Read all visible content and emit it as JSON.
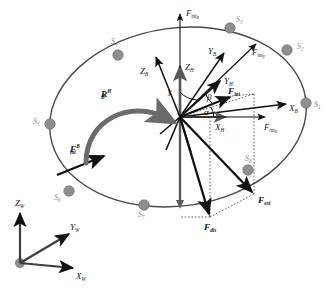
{
  "figure": {
    "type": "force-vector-diagram",
    "colors": {
      "vector_dark": "#111111",
      "axis_gray": "#5a5a5a",
      "node_gray": "#8e8e8e",
      "ring_gray": "#4a4a4a",
      "rotation_arrow": "#6b6b6b",
      "label_dark": "#1a1a1a",
      "label_node": "#8e8e8e",
      "background": "#ffffff"
    }
  },
  "ring": {
    "name": "platform-ellipse",
    "nodes": [
      {
        "id": "S1",
        "label": "S",
        "subscript": "1",
        "x": 306,
        "y": 103,
        "label_x": 314,
        "label_y": 107
      },
      {
        "id": "S2",
        "label": "S",
        "subscript": "2",
        "x": 287,
        "y": 50,
        "label_x": 297,
        "label_y": 49
      },
      {
        "id": "S3",
        "label": "S",
        "subscript": "3",
        "x": 230,
        "y": 28,
        "label_x": 236,
        "label_y": 22
      },
      {
        "id": "S4",
        "label": "S",
        "subscript": "4",
        "x": 118,
        "y": 55,
        "label_x": 113,
        "label_y": 44
      },
      {
        "id": "S5",
        "label": "S",
        "subscript": "5",
        "x": 50,
        "y": 124,
        "label_x": 35,
        "label_y": 124
      },
      {
        "id": "S6",
        "label": "S",
        "subscript": "6",
        "x": 69,
        "y": 191,
        "label_x": 56,
        "label_y": 199
      },
      {
        "id": "S7",
        "label": "S",
        "subscript": "7",
        "x": 144,
        "y": 205,
        "label_x": 140,
        "label_y": 216
      },
      {
        "id": "S8",
        "label": "S",
        "subscript": "8",
        "x": 248,
        "y": 170,
        "label_x": 247,
        "label_y": 161
      }
    ]
  },
  "frames": {
    "world": {
      "name": "world-frame",
      "origin": {
        "x": 20,
        "y": 263
      },
      "axes": [
        {
          "id": "Zw",
          "label": "Z",
          "subscript": "W",
          "tip_x": 20,
          "tip_y": 211,
          "label_x": 18,
          "label_y": 204
        },
        {
          "id": "Yw",
          "label": "Y",
          "subscript": "W",
          "tip_x": 71,
          "tip_y": 233,
          "label_x": 72,
          "label_y": 228
        },
        {
          "id": "Xw",
          "label": "X",
          "subscript": "W",
          "tip_x": 75,
          "tip_y": 268,
          "label_x": 77,
          "label_y": 277
        }
      ]
    },
    "hub": {
      "name": "hub-frame",
      "origin": {
        "x": 180,
        "y": 117
      },
      "axes": [
        {
          "id": "ZH",
          "label": "Z",
          "subscript": "H",
          "tip_x": 180,
          "tip_y": 62,
          "label_x": 185,
          "label_y": 68
        },
        {
          "id": "YH",
          "label": "Y",
          "subscript": "H",
          "tip_x": 222,
          "tip_y": 80,
          "label_x": 224,
          "label_y": 82
        },
        {
          "id": "XH",
          "label": "X",
          "subscript": "H",
          "tip_x": 228,
          "tip_y": 117,
          "label_x": 219,
          "label_y": 128
        }
      ]
    },
    "body": {
      "name": "body-frame",
      "origin": {
        "x": 180,
        "y": 117
      },
      "axes": [
        {
          "id": "ZB",
          "label": "Z",
          "subscript": "B",
          "tip_x": 155,
          "tip_y": 55,
          "label_x": 143,
          "label_y": 72
        },
        {
          "id": "YB",
          "label": "Y",
          "subscript": "B",
          "tip_x": 225,
          "tip_y": 52,
          "label_x": 212,
          "label_y": 53
        },
        {
          "id": "XB",
          "label": "X",
          "subscript": "B",
          "tip_x": 288,
          "tip_y": 104,
          "label_x": 290,
          "label_y": 110
        }
      ]
    }
  },
  "angles": [
    {
      "id": "gamma",
      "glyph": "γ",
      "x": 170,
      "y": 93,
      "between": "Z_H and Y_H"
    },
    {
      "id": "beta",
      "glyph": "β",
      "x": 209,
      "y": 98,
      "between": "Y_H and F_int"
    },
    {
      "id": "alpha",
      "glyph": "α",
      "x": 206,
      "y": 113,
      "between": "X_H and F_int"
    }
  ],
  "vectors": [
    {
      "id": "Fintz",
      "label": "F",
      "subscript": "int",
      "subsub": "z",
      "tip_x": 180,
      "tip_y": 14,
      "label_x": 186,
      "label_y": 14,
      "kind": "component",
      "name": "f-int-z-vector"
    },
    {
      "id": "Finty",
      "label": "F",
      "subscript": "int",
      "subsub": "y",
      "tip_x": 258,
      "tip_y": 42,
      "label_x": 256,
      "label_y": 53,
      "kind": "component",
      "name": "f-int-y-vector"
    },
    {
      "id": "Fintx",
      "label": "F",
      "subscript": "int",
      "subsub": "x",
      "tip_x": 267,
      "tip_y": 117,
      "label_x": 267,
      "label_y": 128,
      "kind": "component",
      "name": "f-int-x-vector"
    },
    {
      "id": "Fint",
      "label": "F",
      "subscript": "int",
      "subsub": "",
      "tip_x": 232,
      "tip_y": 96,
      "label_x": 230,
      "label_y": 95,
      "kind": "resultant",
      "name": "f-int-vector"
    },
    {
      "id": "FintB",
      "label": "F",
      "subscript": "int",
      "superscript": "B",
      "tip_x": 102,
      "tip_y": 155,
      "label_x": 71,
      "label_y": 150,
      "kind": "body-force",
      "name": "f-int-body-vector"
    },
    {
      "id": "Fext",
      "label": "F",
      "subscript": "ext",
      "tip_x": 254,
      "tip_y": 194,
      "label_x": 258,
      "label_y": 202,
      "kind": "external",
      "name": "f-ext-vector"
    },
    {
      "id": "Fdis",
      "label": "F",
      "subscript": "dis",
      "tip_x": 210,
      "tip_y": 217,
      "label_x": 208,
      "label_y": 228,
      "kind": "disturbance",
      "name": "f-dis-vector"
    }
  ],
  "rotation": {
    "id": "RBH",
    "name": "rotation-arrow",
    "label": "R",
    "subscript": "B",
    "superscript": "H",
    "label_x": 104,
    "label_y": 96,
    "description": "curved arrow from body frame to hub frame"
  }
}
